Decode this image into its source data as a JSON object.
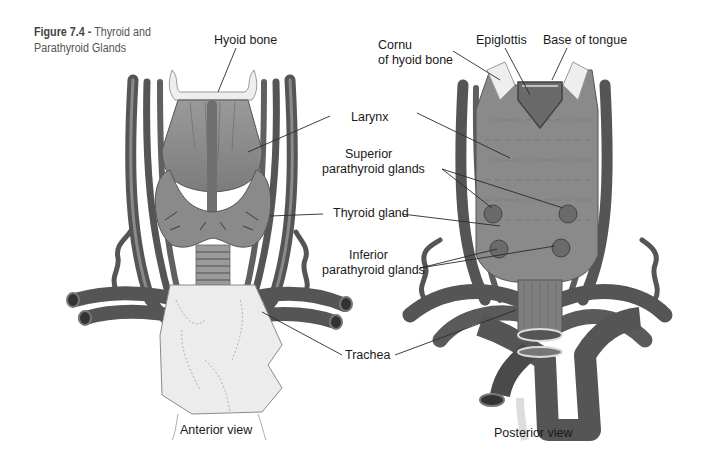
{
  "figure": {
    "number": "Figure 7.4 -",
    "title": "Thyroid and Parathyroid Glands"
  },
  "views": {
    "anterior": {
      "caption": "Anterior view",
      "labels": {
        "hyoid_bone": "Hyoid bone"
      }
    },
    "posterior": {
      "caption": "Posterior view",
      "labels": {
        "cornu_line1": "Cornu",
        "cornu_line2": "of hyoid bone",
        "epiglottis": "Epiglottis",
        "base_of_tongue": "Base of tongue"
      }
    }
  },
  "shared_labels": {
    "larynx": "Larynx",
    "superior_line1": "Superior",
    "superior_line2": "parathyroid glands",
    "thyroid_gland": "Thyroid gland",
    "inferior_line1": "Inferior",
    "inferior_line2": "parathyroid glands",
    "trachea": "Trachea"
  },
  "colors": {
    "vessel": "#5e5e5e",
    "vessel_dark": "#454545",
    "tissue": "#8c8c8c",
    "bone": "#ececec",
    "background": "#ffffff"
  }
}
